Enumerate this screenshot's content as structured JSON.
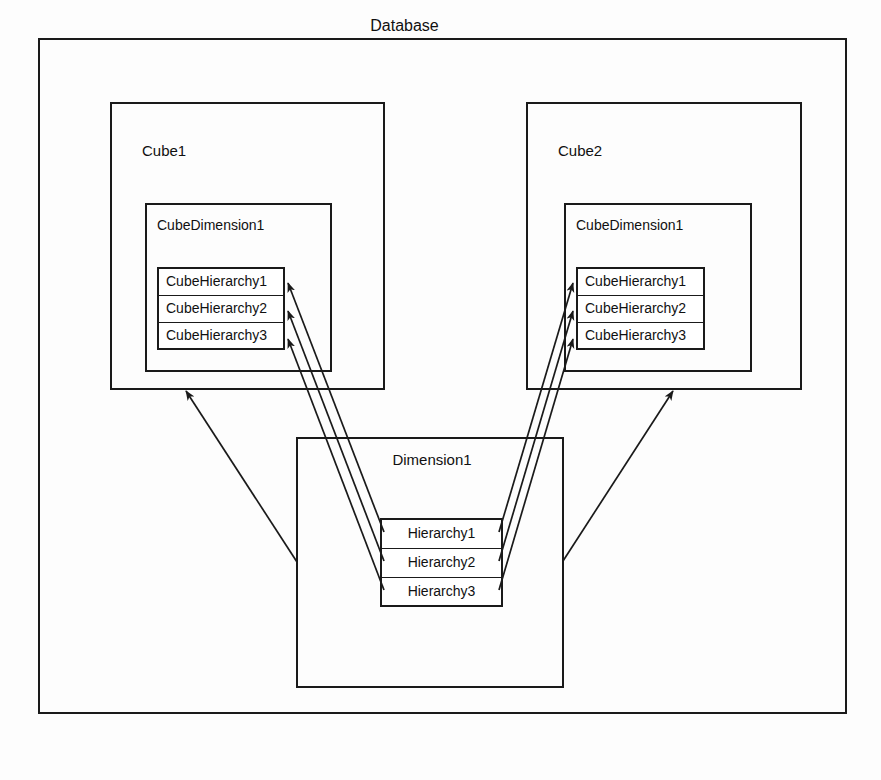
{
  "diagram": {
    "title": "Database",
    "outer": {
      "label": "Database"
    },
    "cubes": [
      {
        "label": "Cube1",
        "cube_dimension": {
          "label": "CubeDimension1",
          "hierarchies": [
            "CubeHierarchy1",
            "CubeHierarchy2",
            "CubeHierarchy3"
          ]
        }
      },
      {
        "label": "Cube2",
        "cube_dimension": {
          "label": "CubeDimension1",
          "hierarchies": [
            "CubeHierarchy1",
            "CubeHierarchy2",
            "CubeHierarchy3"
          ]
        }
      }
    ],
    "dimension": {
      "label": "Dimension1",
      "hierarchies": [
        "Hierarchy1",
        "Hierarchy2",
        "Hierarchy3"
      ]
    },
    "colors": {
      "stroke": "#1a1a1a",
      "background": "#ffffff",
      "text": "#101010"
    },
    "relations": [
      {
        "from": "Dimension1.Hierarchy1",
        "to": "Cube1.CubeDimension1.CubeHierarchy1",
        "style": "arrow"
      },
      {
        "from": "Dimension1.Hierarchy2",
        "to": "Cube1.CubeDimension1.CubeHierarchy2",
        "style": "arrow"
      },
      {
        "from": "Dimension1.Hierarchy3",
        "to": "Cube1.CubeDimension1.CubeHierarchy3",
        "style": "arrow"
      },
      {
        "from": "Dimension1.Hierarchy1",
        "to": "Cube2.CubeDimension1.CubeHierarchy1",
        "style": "arrow"
      },
      {
        "from": "Dimension1.Hierarchy2",
        "to": "Cube2.CubeDimension1.CubeHierarchy2",
        "style": "arrow"
      },
      {
        "from": "Dimension1.Hierarchy3",
        "to": "Cube2.CubeDimension1.CubeHierarchy3",
        "style": "arrow"
      },
      {
        "from": "Dimension1",
        "to": "Cube1",
        "style": "arrow"
      },
      {
        "from": "Dimension1",
        "to": "Cube2",
        "style": "arrow"
      }
    ]
  }
}
